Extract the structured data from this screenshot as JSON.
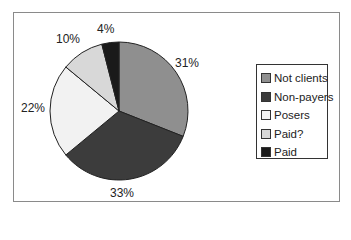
{
  "chart_data": {
    "type": "pie",
    "title": "",
    "categories": [
      "Not clients",
      "Non-payers",
      "Posers",
      "Paid?",
      "Paid"
    ],
    "values": [
      31,
      33,
      22,
      10,
      4
    ],
    "value_labels": [
      "31%",
      "33%",
      "22%",
      "10%",
      "4%"
    ],
    "colors": [
      "#8f8f8f",
      "#3c3c3c",
      "#f2f2f2",
      "#d8d8d8",
      "#1a1a1a"
    ],
    "start_angle_deg": 0,
    "direction": "clockwise",
    "legend_position": "right"
  },
  "legend": {
    "items": [
      {
        "label": "Not clients",
        "color": "#8f8f8f"
      },
      {
        "label": "Non-payers",
        "color": "#3c3c3c"
      },
      {
        "label": "Posers",
        "color": "#f2f2f2"
      },
      {
        "label": "Paid?",
        "color": "#d8d8d8"
      },
      {
        "label": "Paid",
        "color": "#1a1a1a"
      }
    ]
  },
  "labels": {
    "not_clients": "31%",
    "non_payers": "33%",
    "posers": "22%",
    "paid_q": "10%",
    "paid": "4%"
  }
}
